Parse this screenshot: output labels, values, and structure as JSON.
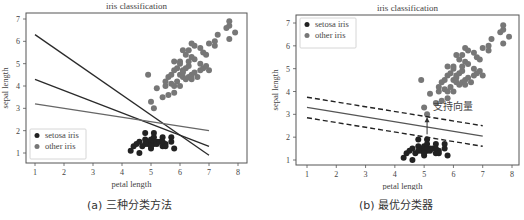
{
  "figure": {
    "panels": [
      {
        "caption": "(a) 三种分类方法",
        "title": "iris classification",
        "xlabel": "petal length",
        "ylabel": "sepal length",
        "legend": [
          {
            "label": "setosa iris",
            "color": "#222222"
          },
          {
            "label": "other iris",
            "color": "#777777"
          }
        ],
        "legend_position": "lower left"
      },
      {
        "caption": "(b) 最优分类器",
        "title": "iris classification",
        "xlabel": "petal length",
        "ylabel": "sepal length",
        "legend": [
          {
            "label": "setosa iris",
            "color": "#222222"
          },
          {
            "label": "other iris",
            "color": "#777777"
          }
        ],
        "legend_position": "upper left",
        "annotation": "支持向量"
      }
    ]
  },
  "chart_data": [
    {
      "type": "scatter",
      "title": "iris classification",
      "xlabel": "petal length",
      "ylabel": "sepal length",
      "xlim": [
        0.7,
        8.3
      ],
      "ylim": [
        0.6,
        7.3
      ],
      "xticks": [
        1,
        2,
        3,
        4,
        5,
        6,
        7,
        8
      ],
      "yticks": [
        1,
        2,
        3,
        4,
        5,
        6,
        7
      ],
      "grid": false,
      "legend_position": "lower left",
      "series": [
        {
          "name": "setosa iris",
          "color": "#222222",
          "points": [
            [
              4.3,
              1.1
            ],
            [
              4.4,
              1.3
            ],
            [
              4.5,
              1.4
            ],
            [
              4.6,
              1.0
            ],
            [
              4.6,
              1.5
            ],
            [
              4.7,
              1.3
            ],
            [
              4.8,
              1.6
            ],
            [
              4.8,
              1.9
            ],
            [
              4.9,
              1.4
            ],
            [
              4.9,
              1.5
            ],
            [
              5.0,
              1.2
            ],
            [
              5.0,
              1.4
            ],
            [
              5.0,
              1.6
            ],
            [
              5.1,
              1.4
            ],
            [
              5.1,
              1.5
            ],
            [
              5.1,
              1.9
            ],
            [
              5.1,
              1.7
            ],
            [
              5.2,
              1.5
            ],
            [
              5.2,
              1.4
            ],
            [
              5.3,
              1.5
            ],
            [
              5.4,
              1.3
            ],
            [
              5.4,
              1.7
            ],
            [
              5.5,
              1.4
            ],
            [
              5.5,
              1.3
            ],
            [
              5.7,
              1.5
            ],
            [
              5.7,
              1.7
            ],
            [
              5.8,
              1.2
            ],
            [
              4.8,
              1.4
            ],
            [
              5.0,
              1.3
            ],
            [
              5.4,
              1.5
            ]
          ]
        },
        {
          "name": "other iris",
          "color": "#777777",
          "points": [
            [
              4.9,
              4.5
            ],
            [
              5.0,
              3.3
            ],
            [
              5.1,
              3.0
            ],
            [
              5.2,
              3.9
            ],
            [
              5.4,
              3.5
            ],
            [
              5.5,
              4.0
            ],
            [
              5.5,
              4.2
            ],
            [
              5.6,
              3.6
            ],
            [
              5.6,
              4.4
            ],
            [
              5.7,
              4.1
            ],
            [
              5.7,
              4.5
            ],
            [
              5.8,
              3.7
            ],
            [
              5.8,
              4.0
            ],
            [
              5.8,
              4.7
            ],
            [
              5.9,
              4.2
            ],
            [
              5.9,
              4.8
            ],
            [
              6.0,
              4.0
            ],
            [
              6.0,
              4.5
            ],
            [
              6.0,
              5.1
            ],
            [
              6.1,
              4.4
            ],
            [
              6.1,
              4.7
            ],
            [
              6.1,
              5.6
            ],
            [
              6.2,
              4.3
            ],
            [
              6.2,
              4.8
            ],
            [
              6.2,
              5.4
            ],
            [
              6.3,
              4.4
            ],
            [
              6.3,
              4.9
            ],
            [
              6.3,
              5.6
            ],
            [
              6.4,
              4.5
            ],
            [
              6.4,
              5.3
            ],
            [
              6.4,
              5.9
            ],
            [
              6.5,
              4.6
            ],
            [
              6.5,
              5.2
            ],
            [
              6.5,
              5.8
            ],
            [
              6.6,
              4.4
            ],
            [
              6.7,
              4.7
            ],
            [
              6.7,
              5.0
            ],
            [
              6.7,
              5.7
            ],
            [
              6.8,
              4.8
            ],
            [
              6.8,
              5.5
            ],
            [
              6.9,
              4.9
            ],
            [
              6.9,
              5.4
            ],
            [
              7.0,
              4.7
            ],
            [
              7.0,
              5.9
            ],
            [
              7.2,
              5.8
            ],
            [
              7.2,
              6.0
            ],
            [
              7.3,
              6.3
            ],
            [
              7.6,
              6.6
            ],
            [
              7.7,
              6.7
            ],
            [
              7.7,
              6.9
            ],
            [
              7.9,
              6.4
            ],
            [
              7.7,
              6.1
            ],
            [
              6.0,
              5.0
            ],
            [
              6.3,
              5.1
            ],
            [
              5.8,
              5.1
            ],
            [
              6.1,
              4.6
            ],
            [
              6.4,
              4.3
            ]
          ]
        }
      ],
      "lines": [
        {
          "name": "classifier 1",
          "color": "#2a2a2a",
          "from": [
            1,
            6.3
          ],
          "to": [
            7,
            0.9
          ]
        },
        {
          "name": "classifier 2",
          "color": "#2a2a2a",
          "from": [
            1,
            4.3
          ],
          "to": [
            7,
            1.3
          ]
        },
        {
          "name": "classifier 3",
          "color": "#666666",
          "from": [
            1,
            3.2
          ],
          "to": [
            7,
            2.0
          ]
        }
      ]
    },
    {
      "type": "scatter",
      "title": "iris classification",
      "xlabel": "petal length",
      "ylabel": "sepal length",
      "xlim": [
        0.7,
        8.3
      ],
      "ylim": [
        0.6,
        7.3
      ],
      "xticks": [
        1,
        2,
        3,
        4,
        5,
        6,
        7,
        8
      ],
      "yticks": [
        1,
        2,
        3,
        4,
        5,
        6,
        7
      ],
      "grid": false,
      "legend_position": "upper left",
      "annotations": [
        {
          "text": "支持向量",
          "at": [
            5.1,
            3.0
          ]
        }
      ],
      "series": [
        {
          "name": "setosa iris",
          "color": "#222222",
          "points": [
            [
              4.3,
              1.1
            ],
            [
              4.4,
              1.3
            ],
            [
              4.5,
              1.4
            ],
            [
              4.6,
              1.0
            ],
            [
              4.6,
              1.5
            ],
            [
              4.7,
              1.3
            ],
            [
              4.8,
              1.6
            ],
            [
              4.8,
              1.9
            ],
            [
              4.9,
              1.4
            ],
            [
              4.9,
              1.5
            ],
            [
              5.0,
              1.2
            ],
            [
              5.0,
              1.4
            ],
            [
              5.0,
              1.6
            ],
            [
              5.1,
              1.4
            ],
            [
              5.1,
              1.5
            ],
            [
              5.1,
              1.9
            ],
            [
              5.1,
              1.7
            ],
            [
              5.2,
              1.5
            ],
            [
              5.2,
              1.4
            ],
            [
              5.3,
              1.5
            ],
            [
              5.4,
              1.3
            ],
            [
              5.4,
              1.7
            ],
            [
              5.5,
              1.4
            ],
            [
              5.5,
              1.3
            ],
            [
              5.7,
              1.5
            ],
            [
              5.7,
              1.7
            ],
            [
              5.8,
              1.2
            ],
            [
              4.8,
              1.4
            ],
            [
              5.0,
              1.3
            ],
            [
              5.4,
              1.5
            ]
          ]
        },
        {
          "name": "other iris",
          "color": "#777777",
          "points": [
            [
              4.9,
              4.5
            ],
            [
              5.0,
              3.3
            ],
            [
              5.1,
              3.0
            ],
            [
              5.2,
              3.9
            ],
            [
              5.4,
              3.5
            ],
            [
              5.5,
              4.0
            ],
            [
              5.5,
              4.2
            ],
            [
              5.6,
              3.6
            ],
            [
              5.6,
              4.4
            ],
            [
              5.7,
              4.1
            ],
            [
              5.7,
              4.5
            ],
            [
              5.8,
              3.7
            ],
            [
              5.8,
              4.0
            ],
            [
              5.8,
              4.7
            ],
            [
              5.9,
              4.2
            ],
            [
              5.9,
              4.8
            ],
            [
              6.0,
              4.0
            ],
            [
              6.0,
              4.5
            ],
            [
              6.0,
              5.1
            ],
            [
              6.1,
              4.4
            ],
            [
              6.1,
              4.7
            ],
            [
              6.1,
              5.6
            ],
            [
              6.2,
              4.3
            ],
            [
              6.2,
              4.8
            ],
            [
              6.2,
              5.4
            ],
            [
              6.3,
              4.4
            ],
            [
              6.3,
              4.9
            ],
            [
              6.3,
              5.6
            ],
            [
              6.4,
              4.5
            ],
            [
              6.4,
              5.3
            ],
            [
              6.4,
              5.9
            ],
            [
              6.5,
              4.6
            ],
            [
              6.5,
              5.2
            ],
            [
              6.5,
              5.8
            ],
            [
              6.6,
              4.4
            ],
            [
              6.7,
              4.7
            ],
            [
              6.7,
              5.0
            ],
            [
              6.7,
              5.7
            ],
            [
              6.8,
              4.8
            ],
            [
              6.8,
              5.5
            ],
            [
              6.9,
              4.9
            ],
            [
              6.9,
              5.4
            ],
            [
              7.0,
              4.7
            ],
            [
              7.0,
              5.9
            ],
            [
              7.2,
              5.8
            ],
            [
              7.2,
              6.0
            ],
            [
              7.3,
              6.3
            ],
            [
              7.6,
              6.6
            ],
            [
              7.7,
              6.7
            ],
            [
              7.7,
              6.9
            ],
            [
              7.9,
              6.4
            ],
            [
              7.7,
              6.1
            ],
            [
              6.0,
              5.0
            ],
            [
              6.3,
              5.1
            ],
            [
              5.8,
              5.1
            ],
            [
              6.1,
              4.6
            ],
            [
              6.4,
              4.3
            ]
          ]
        }
      ],
      "lines": [
        {
          "name": "optimal hyperplane",
          "style": "solid",
          "color": "#555555",
          "from": [
            1,
            3.3
          ],
          "to": [
            7,
            2.05
          ]
        },
        {
          "name": "margin upper",
          "style": "dashed",
          "color": "#222222",
          "from": [
            1,
            3.75
          ],
          "to": [
            7,
            2.5
          ]
        },
        {
          "name": "margin lower",
          "style": "dashed",
          "color": "#222222",
          "from": [
            1,
            2.85
          ],
          "to": [
            7,
            1.6
          ]
        }
      ]
    }
  ]
}
